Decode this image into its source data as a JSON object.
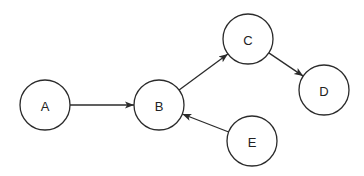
{
  "diagram": {
    "type": "directed-graph",
    "nodes": [
      {
        "id": "A",
        "label": "A",
        "x": 45,
        "y": 105,
        "r": 25
      },
      {
        "id": "B",
        "label": "B",
        "x": 159,
        "y": 105,
        "r": 25
      },
      {
        "id": "C",
        "label": "C",
        "x": 248,
        "y": 39,
        "r": 25
      },
      {
        "id": "D",
        "label": "D",
        "x": 324,
        "y": 90,
        "r": 25
      },
      {
        "id": "E",
        "label": "E",
        "x": 252,
        "y": 141,
        "r": 25
      }
    ],
    "edges": [
      {
        "from": "A",
        "to": "B"
      },
      {
        "from": "B",
        "to": "C"
      },
      {
        "from": "C",
        "to": "D"
      },
      {
        "from": "E",
        "to": "B"
      }
    ],
    "colors": {
      "stroke": "#2b2b2b",
      "fill": "#ffffff",
      "text": "#222222",
      "background": "#ffffff"
    }
  }
}
